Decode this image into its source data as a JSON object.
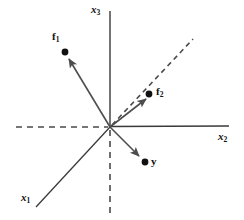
{
  "figure": {
    "background_color": "#ffffff",
    "line_color": "#3a3a3a",
    "dash_color": "#4a4a4a",
    "vector_color": "#4d4d4d",
    "point_color": "#111111",
    "width": 244,
    "height": 220,
    "origin": {
      "x": 110,
      "y": 127
    }
  },
  "axes": [
    {
      "id": "x3",
      "label_main": "x",
      "label_sub": "3",
      "label_x": 91,
      "label_y": 5,
      "style": "solid",
      "from": {
        "x": 110,
        "y": 11
      },
      "to": {
        "x": 110,
        "y": 127
      },
      "description": "vertical axis upward"
    },
    {
      "id": "x2",
      "label_main": "x",
      "label_sub": "2",
      "label_x": 218,
      "label_y": 132,
      "style": "solid",
      "from": {
        "x": 110,
        "y": 127
      },
      "to": {
        "x": 229,
        "y": 126
      },
      "description": "horizontal axis to the right"
    },
    {
      "id": "x1",
      "label_main": "x",
      "label_sub": "1",
      "label_x": 21,
      "label_y": 193,
      "style": "solid",
      "from": {
        "x": 110,
        "y": 127
      },
      "to": {
        "x": 36,
        "y": 207
      },
      "description": "oblique axis toward lower-left"
    }
  ],
  "dashed_axes": [
    {
      "id": "x2-negative",
      "from": {
        "x": 16,
        "y": 127
      },
      "to": {
        "x": 110,
        "y": 127
      },
      "description": "negative x2 direction, dashed"
    },
    {
      "id": "x3-negative",
      "from": {
        "x": 110,
        "y": 127
      },
      "to": {
        "x": 110,
        "y": 213
      },
      "description": "negative x3 direction, dashed"
    },
    {
      "id": "x1-negative",
      "from": {
        "x": 110,
        "y": 127
      },
      "to": {
        "x": 193,
        "y": 39
      },
      "description": "negative x1 direction, dashed diagonal"
    }
  ],
  "vectors": [
    {
      "id": "f1",
      "label_main": "f",
      "label_sub": "1",
      "label_x": 52,
      "label_y": 32,
      "from": {
        "x": 110,
        "y": 127
      },
      "to": {
        "x": 68,
        "y": 58
      },
      "point": {
        "x": 65,
        "y": 52
      },
      "point_radius": 3.4,
      "arrow": true
    },
    {
      "id": "f2",
      "label_main": "f",
      "label_sub": "2",
      "label_x": 156,
      "label_y": 87,
      "from": {
        "x": 110,
        "y": 127
      },
      "to": {
        "x": 145,
        "y": 98
      },
      "point": {
        "x": 149,
        "y": 94
      },
      "point_radius": 3.4,
      "arrow": true
    },
    {
      "id": "y",
      "label_main": "y",
      "label_sub": "",
      "label_x": 151,
      "label_y": 157,
      "from": {
        "x": 110,
        "y": 127
      },
      "to": {
        "x": 140,
        "y": 157
      },
      "point": {
        "x": 145,
        "y": 162
      },
      "point_radius": 3.4,
      "arrow": true
    }
  ]
}
